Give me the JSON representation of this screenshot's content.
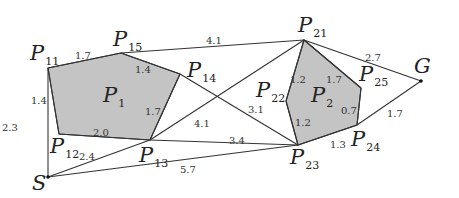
{
  "diagram": {
    "type": "visibility-graph",
    "vertices": {
      "S": {
        "name": "S",
        "sub": "",
        "x": 48,
        "y": 177,
        "lx": 32,
        "ly": 190
      },
      "G": {
        "name": "G",
        "sub": "",
        "x": 421,
        "y": 81,
        "lx": 414,
        "ly": 73
      },
      "P11": {
        "name": "P",
        "sub": "11",
        "x": 48,
        "y": 68,
        "lx": 30,
        "ly": 60
      },
      "P12": {
        "name": "P",
        "sub": "12",
        "x": 59,
        "y": 134,
        "lx": 50,
        "ly": 153
      },
      "P13": {
        "name": "P",
        "sub": "13",
        "x": 150,
        "y": 140,
        "lx": 139,
        "ly": 162
      },
      "P14": {
        "name": "P",
        "sub": "14",
        "x": 180,
        "y": 74,
        "lx": 187,
        "ly": 77
      },
      "P15": {
        "name": "P",
        "sub": "15",
        "x": 121,
        "y": 53,
        "lx": 113,
        "ly": 46
      },
      "P21": {
        "name": "P",
        "sub": "21",
        "x": 304,
        "y": 40,
        "lx": 298,
        "ly": 32
      },
      "P22": {
        "name": "P",
        "sub": "22",
        "x": 286,
        "y": 101,
        "lx": 256,
        "ly": 97
      },
      "P23": {
        "name": "P",
        "sub": "23",
        "x": 298,
        "y": 145,
        "lx": 290,
        "ly": 164
      },
      "P24": {
        "name": "P",
        "sub": "24",
        "x": 357,
        "y": 125,
        "lx": 351,
        "ly": 146
      },
      "P25": {
        "name": "P",
        "sub": "25",
        "x": 361,
        "y": 88,
        "lx": 359,
        "ly": 81
      }
    },
    "obstacles": [
      {
        "name": "P",
        "sub": "1",
        "points": [
          "P11",
          "P15",
          "P14",
          "P13",
          "P12"
        ],
        "lx": 103,
        "ly": 102
      },
      {
        "name": "P",
        "sub": "2",
        "points": [
          "P21",
          "P25",
          "P24",
          "P23",
          "P22"
        ],
        "lx": 311,
        "ly": 102
      }
    ],
    "edges": [
      {
        "a": "P11",
        "b": "P15",
        "w": "1.7",
        "wx": 75,
        "wy": 59
      },
      {
        "a": "P15",
        "b": "P14",
        "w": "1.4",
        "wx": 135,
        "wy": 73
      },
      {
        "a": "P14",
        "b": "P13",
        "w": "1.7",
        "wx": 145,
        "wy": 115
      },
      {
        "a": "P12",
        "b": "P13",
        "w": "2.0",
        "wx": 93,
        "wy": 136
      },
      {
        "a": "P11",
        "b": "P12",
        "w": "1.4",
        "wx": 31,
        "wy": 104
      },
      {
        "a": "P11",
        "b": "S",
        "w": "2.3",
        "wx": 2,
        "wy": 131
      },
      {
        "a": "S",
        "b": "P13",
        "w": "2.4",
        "wx": 79,
        "wy": 160
      },
      {
        "a": "S",
        "b": "P23",
        "w": "5.7",
        "wx": 180,
        "wy": 173
      },
      {
        "a": "P13",
        "b": "P23",
        "w": "3.4",
        "wx": 229,
        "wy": 144
      },
      {
        "a": "P13",
        "b": "P21",
        "w": "4.1",
        "wx": 194,
        "wy": 127
      },
      {
        "a": "P15",
        "b": "P21",
        "w": "4.1",
        "wx": 206,
        "wy": 44
      },
      {
        "a": "P14",
        "b": "P23",
        "w": "3.1",
        "wx": 248,
        "wy": 113
      },
      {
        "a": "P21",
        "b": "P22",
        "w": "1.2",
        "wx": 290,
        "wy": 83
      },
      {
        "a": "P21",
        "b": "P25",
        "w": "1.7",
        "wx": 326,
        "wy": 83
      },
      {
        "a": "P25",
        "b": "P24",
        "w": "0.7",
        "wx": 341,
        "wy": 114
      },
      {
        "a": "P24",
        "b": "P23",
        "w": "1.3",
        "wx": 330,
        "wy": 148
      },
      {
        "a": "P22",
        "b": "P23",
        "w": "1.2",
        "wx": 295,
        "wy": 126
      },
      {
        "a": "P21",
        "b": "G",
        "w": "2.7",
        "wx": 365,
        "wy": 61
      },
      {
        "a": "P24",
        "b": "G",
        "w": "1.7",
        "wx": 387,
        "wy": 117
      }
    ]
  },
  "colors": {
    "obstacle_fill": "#c4c4c4",
    "edge": "#333333",
    "background": "#ffffff"
  }
}
